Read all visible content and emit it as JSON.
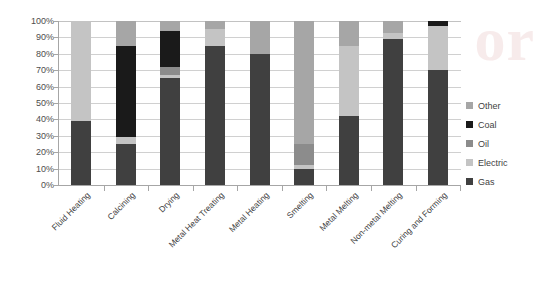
{
  "watermark": {
    "text": "or"
  },
  "chart_data": {
    "type": "bar",
    "variant": "stacked-100-percent",
    "title": "",
    "xlabel": "",
    "ylabel": "",
    "ylim": [
      0,
      100
    ],
    "ytick_labels": [
      "0%",
      "10%",
      "20%",
      "30%",
      "40%",
      "50%",
      "60%",
      "70%",
      "80%",
      "90%",
      "100%"
    ],
    "ytick_values": [
      0,
      10,
      20,
      30,
      40,
      50,
      60,
      70,
      80,
      90,
      100
    ],
    "grid": true,
    "legend_position": "right",
    "legend_order": [
      "Other",
      "Coal",
      "Oil",
      "Electric",
      "Gas"
    ],
    "categories": [
      "Fluid Heating",
      "Calcining",
      "Drying",
      "Metal Heat Treating",
      "Metal Heating",
      "Smelting",
      "Metal Melting",
      "Non-metal Melting",
      "Curing and Forming"
    ],
    "series": [
      {
        "name": "Gas",
        "color": "#404040",
        "values": [
          39,
          25,
          65,
          85,
          80,
          10,
          42,
          89,
          70
        ]
      },
      {
        "name": "Electric",
        "color": "#c4c4c4",
        "values": [
          61,
          4,
          2,
          10,
          0,
          2,
          43,
          4,
          27
        ]
      },
      {
        "name": "Oil",
        "color": "#8c8c8c",
        "values": [
          0,
          0,
          5,
          0,
          0,
          13,
          0,
          0,
          0
        ]
      },
      {
        "name": "Coal",
        "color": "#1a1a1a",
        "values": [
          0,
          56,
          22,
          0,
          0,
          0,
          0,
          0,
          3
        ]
      },
      {
        "name": "Other",
        "color": "#a6a6a6",
        "values": [
          0,
          15,
          6,
          5,
          20,
          75,
          15,
          7,
          0
        ]
      }
    ]
  }
}
